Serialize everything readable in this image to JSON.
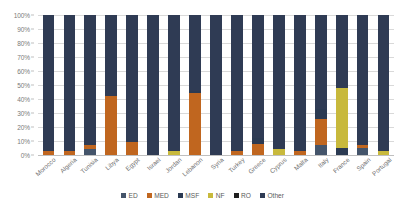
{
  "chart_data": {
    "type": "bar",
    "stacked": true,
    "normalized": "100%",
    "title": "",
    "subtitle": "",
    "xlabel": "",
    "ylabel": "",
    "ylim": [
      0,
      100
    ],
    "grid": true,
    "legend_position": "bottom",
    "categories": [
      "Morocco",
      "Algeria",
      "Tunisia",
      "Libya",
      "Egypt",
      "Israel",
      "Jordan",
      "Lebanon",
      "Syria",
      "Turkey",
      "Greece",
      "Cyprus",
      "Malta",
      "Italy",
      "France",
      "Spain",
      "Portugal"
    ],
    "tick_labels": [
      "0%",
      "10%",
      "20%",
      "30%",
      "40%",
      "50%",
      "60%",
      "70%",
      "80%",
      "90%",
      "100%"
    ],
    "tick_values": [
      0,
      10,
      20,
      30,
      40,
      50,
      60,
      70,
      80,
      90,
      100
    ],
    "series": [
      {
        "name": "ED",
        "color": "#44546a",
        "values": [
          0,
          0,
          4,
          0,
          0,
          0,
          0,
          0,
          0,
          0,
          0,
          0,
          0,
          7,
          0,
          5,
          0
        ]
      },
      {
        "name": "MED",
        "color": "#c0661f",
        "values": [
          3,
          3,
          3,
          42,
          9,
          0,
          0,
          44,
          0,
          3,
          8,
          0,
          3,
          19,
          0,
          2,
          0
        ]
      },
      {
        "name": "MSF",
        "color": "#2b3a52",
        "values": [
          0,
          0,
          0,
          0,
          0,
          0,
          0,
          2,
          0,
          0,
          4,
          0,
          0,
          7,
          5,
          0,
          0
        ]
      },
      {
        "name": "NF",
        "color": "#c8b93c",
        "values": [
          0,
          0,
          0,
          0,
          0,
          0,
          3,
          0,
          0,
          0,
          0,
          4,
          0,
          0,
          43,
          0,
          3
        ]
      },
      {
        "name": "RO",
        "color": "#1f1f1f",
        "values": [
          0,
          0,
          0,
          0,
          0,
          0,
          0,
          0,
          0,
          0,
          0,
          0,
          0,
          0,
          0,
          0,
          0
        ]
      },
      {
        "name": "Other",
        "color": "#2f3b54",
        "values": [
          97,
          97,
          93,
          58,
          91,
          100,
          97,
          54,
          100,
          97,
          88,
          96,
          97,
          67,
          52,
          93,
          97
        ]
      }
    ]
  },
  "legend": {
    "items": [
      {
        "label": "ED",
        "color": "#44546a"
      },
      {
        "label": "MED",
        "color": "#c0661f"
      },
      {
        "label": "MSF",
        "color": "#2b3a52"
      },
      {
        "label": "NF",
        "color": "#c8b93c"
      },
      {
        "label": "RO",
        "color": "#1f1f1f"
      },
      {
        "label": "Other",
        "color": "#2f3b54"
      }
    ]
  }
}
